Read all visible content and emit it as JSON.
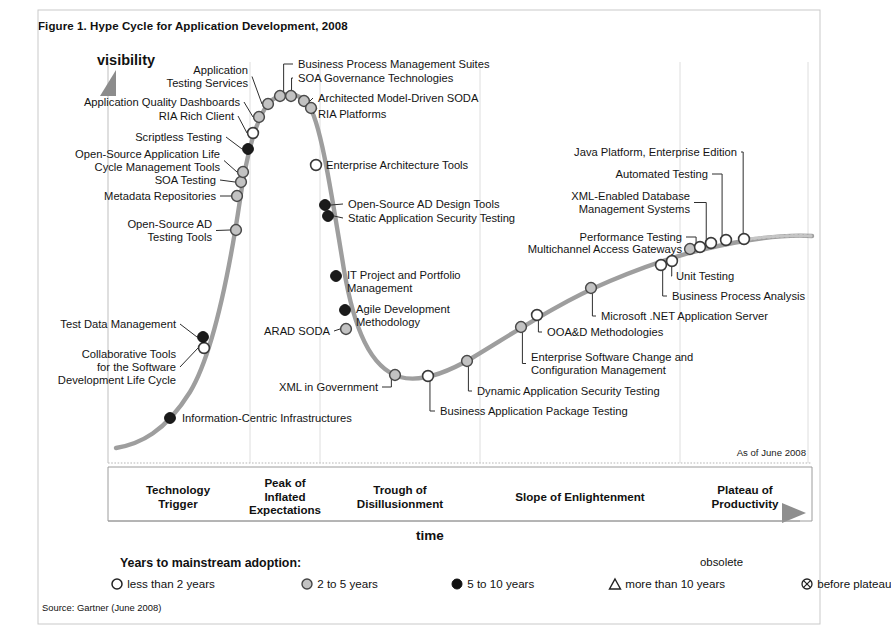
{
  "figure": {
    "title": "Figure 1. Hype Cycle for Application Development, 2008",
    "source": "Source: Gartner (June 2008)",
    "as_of": "As of June 2008"
  },
  "axes": {
    "y_label": "visibility",
    "x_label": "time"
  },
  "phases": [
    {
      "name": "Technology Trigger",
      "line1": "Technology",
      "line2": "Trigger",
      "line3": "",
      "x_center": 178,
      "y": 483
    },
    {
      "name": "Peak of Inflated Expectations",
      "line1": "Peak of",
      "line2": "Inflated",
      "line3": "Expectations",
      "x_center": 285,
      "y": 476
    },
    {
      "name": "Trough of Disillusionment",
      "line1": "Trough of",
      "line2": "Disillusionment",
      "line3": "",
      "x_center": 400,
      "y": 483
    },
    {
      "name": "Slope of Enlightenment",
      "line1": "Slope of Enlightenment",
      "line2": "",
      "line3": "",
      "x_center": 580,
      "y": 490
    },
    {
      "name": "Plateau of Productivity",
      "line1": "Plateau of",
      "line2": "Productivity",
      "line3": "",
      "x_center": 745,
      "y": 483
    }
  ],
  "legend": {
    "title": "Years to mainstream adoption:",
    "obsolete_line1": "obsolete",
    "items": [
      {
        "symbol": "open-circle",
        "label": "less than 2 years",
        "x": 0
      },
      {
        "symbol": "light-gray-circle",
        "label": "2 to 5 years",
        "x": 190
      },
      {
        "symbol": "filled-black-circle",
        "label": "5 to 10 years",
        "x": 340
      },
      {
        "symbol": "triangle",
        "label": "more than 10 years",
        "x": 498
      },
      {
        "symbol": "crossed-circle",
        "label": "before plateau",
        "x": 690
      }
    ]
  },
  "chart_data": {
    "type": "line",
    "title": "Hype Cycle for Application Development, 2008",
    "xlabel": "time",
    "ylabel": "visibility",
    "grid": true,
    "legend_position": "bottom",
    "phase_boundaries_px": [
      108,
      250,
      320,
      480,
      680,
      808
    ],
    "points": [
      {
        "label": "Information-Centric Infrastructures",
        "maturity": "5 to 10 years",
        "symbol": "filled-black-circle",
        "x": 170,
        "y": 418,
        "label_x": 182,
        "label_y": 412,
        "align": "left",
        "leader": "none"
      },
      {
        "label": "Collaborative Tools\nfor the Software\nDevelopment Life Cycle",
        "maturity": "less than 2 years",
        "symbol": "open-circle",
        "x": 204,
        "y": 348,
        "label_x": 176,
        "label_y": 348,
        "align": "right",
        "leader": "dash"
      },
      {
        "label": "Test Data Management",
        "maturity": "5 to 10 years",
        "symbol": "filled-black-circle",
        "x": 203,
        "y": 337,
        "label_x": 176,
        "label_y": 318,
        "align": "right",
        "leader": "dash"
      },
      {
        "label": "Open-Source AD\nTesting Tools",
        "maturity": "2 to 5 years",
        "symbol": "light-gray-circle",
        "x": 236,
        "y": 230,
        "label_x": 212,
        "label_y": 218,
        "align": "right",
        "leader": "dash"
      },
      {
        "label": "Metadata Repositories",
        "maturity": "2 to 5 years",
        "symbol": "light-gray-circle",
        "x": 237,
        "y": 196,
        "label_x": 216,
        "label_y": 190,
        "align": "right",
        "leader": "dash"
      },
      {
        "label": "SOA Testing",
        "maturity": "2 to 5 years",
        "symbol": "light-gray-circle",
        "x": 241,
        "y": 182,
        "label_x": 216,
        "label_y": 174,
        "align": "right",
        "leader": "dash"
      },
      {
        "label": "Open-Source Application Life\nCycle Management Tools",
        "maturity": "2 to 5 years",
        "symbol": "light-gray-circle",
        "x": 243,
        "y": 172,
        "label_x": 220,
        "label_y": 148,
        "align": "right",
        "leader": "dash"
      },
      {
        "label": "Scriptless Testing",
        "maturity": "5 to 10 years",
        "symbol": "filled-black-circle",
        "x": 248,
        "y": 149,
        "label_x": 222,
        "label_y": 131,
        "align": "right",
        "leader": "dash"
      },
      {
        "label": "RIA Rich Client",
        "maturity": "less than 2 years",
        "symbol": "open-circle",
        "x": 253,
        "y": 133,
        "label_x": 234,
        "label_y": 110,
        "align": "right",
        "leader": "dash"
      },
      {
        "label": "Application Quality Dashboards",
        "maturity": "2 to 5 years",
        "symbol": "light-gray-circle",
        "x": 259,
        "y": 117,
        "label_x": 240,
        "label_y": 96,
        "align": "right",
        "leader": "dash"
      },
      {
        "label": "Application\nTesting Services",
        "maturity": "2 to 5 years",
        "symbol": "light-gray-circle",
        "x": 268,
        "y": 104,
        "label_x": 248,
        "label_y": 64,
        "align": "right",
        "leader": "dash"
      },
      {
        "label": "Business Process Management Suites",
        "maturity": "2 to 5 years",
        "symbol": "light-gray-circle",
        "x": 280,
        "y": 96,
        "label_x": 298,
        "label_y": 58,
        "align": "left",
        "leader": "elbow"
      },
      {
        "label": "SOA Governance Technologies",
        "maturity": "2 to 5 years",
        "symbol": "light-gray-circle",
        "x": 291,
        "y": 96,
        "label_x": 298,
        "label_y": 72,
        "align": "left",
        "leader": "elbow"
      },
      {
        "label": "Architected Model-Driven SODA",
        "maturity": "2 to 5 years",
        "symbol": "light-gray-circle",
        "x": 304,
        "y": 101,
        "label_x": 318,
        "label_y": 92,
        "align": "left",
        "leader": "dash"
      },
      {
        "label": "RIA Platforms",
        "maturity": "2 to 5 years",
        "symbol": "light-gray-circle",
        "x": 311,
        "y": 108,
        "label_x": 318,
        "label_y": 108,
        "align": "left",
        "leader": "dash"
      },
      {
        "label": "Enterprise Architecture Tools",
        "maturity": "less than 2 years",
        "symbol": "open-circle",
        "x": 316,
        "y": 165,
        "label_x": 326,
        "label_y": 159,
        "align": "left",
        "leader": "none"
      },
      {
        "label": "Open-Source AD Design Tools",
        "maturity": "5 to 10 years",
        "symbol": "filled-black-circle",
        "x": 325,
        "y": 205,
        "label_x": 348,
        "label_y": 198,
        "align": "left",
        "leader": "dash"
      },
      {
        "label": "Static Application Security Testing",
        "maturity": "5 to 10 years",
        "symbol": "filled-black-circle",
        "x": 328,
        "y": 216,
        "label_x": 348,
        "label_y": 212,
        "align": "left",
        "leader": "dash"
      },
      {
        "label": "IT Project and Portfolio\nManagement",
        "maturity": "5 to 10 years",
        "symbol": "filled-black-circle",
        "x": 336,
        "y": 276,
        "label_x": 347,
        "label_y": 269,
        "align": "left",
        "leader": "none"
      },
      {
        "label": "Agile Development\nMethodology",
        "maturity": "5 to 10 years",
        "symbol": "filled-black-circle",
        "x": 345,
        "y": 310,
        "label_x": 356,
        "label_y": 303,
        "align": "left",
        "leader": "none"
      },
      {
        "label": "ARAD SODA",
        "maturity": "2 to 5 years",
        "symbol": "light-gray-circle",
        "x": 346,
        "y": 329,
        "label_x": 330,
        "label_y": 325,
        "align": "right",
        "leader": "dash"
      },
      {
        "label": "XML in Government",
        "maturity": "2 to 5 years",
        "symbol": "light-gray-circle",
        "x": 395,
        "y": 375,
        "label_x": 378,
        "label_y": 381,
        "align": "right",
        "leader": "elbow"
      },
      {
        "label": "Business Application Package Testing",
        "maturity": "less than 2 years",
        "symbol": "open-circle",
        "x": 428,
        "y": 376,
        "label_x": 440,
        "label_y": 405,
        "align": "left",
        "leader": "elbow"
      },
      {
        "label": "Dynamic Application Security Testing",
        "maturity": "2 to 5 years",
        "symbol": "light-gray-circle",
        "x": 467,
        "y": 361,
        "label_x": 477,
        "label_y": 385,
        "align": "left",
        "leader": "elbow"
      },
      {
        "label": "Enterprise Software Change and\nConfiguration Management",
        "maturity": "2 to 5 years",
        "symbol": "light-gray-circle",
        "x": 521,
        "y": 327,
        "label_x": 531,
        "label_y": 351,
        "align": "left",
        "leader": "elbow"
      },
      {
        "label": "OOA&D Methodologies",
        "maturity": "less than 2 years",
        "symbol": "open-circle",
        "x": 537,
        "y": 315,
        "label_x": 547,
        "label_y": 326,
        "align": "left",
        "leader": "elbow"
      },
      {
        "label": "Microsoft .NET Application Server",
        "maturity": "2 to 5 years",
        "symbol": "light-gray-circle",
        "x": 591,
        "y": 288,
        "label_x": 601,
        "label_y": 310,
        "align": "left",
        "leader": "elbow"
      },
      {
        "label": "Business Process Analysis",
        "maturity": "less than 2 years",
        "symbol": "open-circle",
        "x": 661,
        "y": 265,
        "label_x": 672,
        "label_y": 290,
        "align": "left",
        "leader": "elbow"
      },
      {
        "label": "Unit Testing",
        "maturity": "less than 2 years",
        "symbol": "open-circle",
        "x": 672,
        "y": 261,
        "label_x": 676,
        "label_y": 270,
        "align": "left",
        "leader": "elbow"
      },
      {
        "label": "Multichannel Access Gateways",
        "maturity": "2 to 5 years",
        "symbol": "light-gray-circle",
        "x": 690,
        "y": 249,
        "label_x": 682,
        "label_y": 243,
        "align": "right",
        "leader": "elbow"
      },
      {
        "label": "Performance Testing",
        "maturity": "less than 2 years",
        "symbol": "open-circle",
        "x": 700,
        "y": 247,
        "label_x": 682,
        "label_y": 231,
        "align": "right",
        "leader": "elbow"
      },
      {
        "label": "XML-Enabled Database\nManagement Systems",
        "maturity": "less than 2 years",
        "symbol": "open-circle",
        "x": 711,
        "y": 243,
        "label_x": 690,
        "label_y": 190,
        "align": "right",
        "leader": "elbow"
      },
      {
        "label": "Automated Testing",
        "maturity": "less than 2 years",
        "symbol": "open-circle",
        "x": 726,
        "y": 240,
        "label_x": 708,
        "label_y": 168,
        "align": "right",
        "leader": "elbow"
      },
      {
        "label": "Java Platform, Enterprise Edition",
        "maturity": "less than 2 years",
        "symbol": "open-circle",
        "x": 744,
        "y": 239,
        "label_x": 737,
        "label_y": 146,
        "align": "right",
        "leader": "elbow"
      }
    ]
  }
}
